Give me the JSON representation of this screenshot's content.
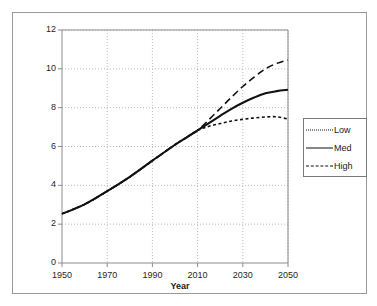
{
  "chart_data": {
    "type": "line",
    "title": "",
    "subtitle": "",
    "xlabel": "Year",
    "ylabel": "",
    "xlim": [
      1950,
      2050
    ],
    "ylim": [
      0,
      12
    ],
    "grid": true,
    "grid_style": "dotted",
    "legend_position": "right-outside",
    "x_ticks": [
      "1950",
      "1970",
      "1990",
      "2010",
      "2030",
      "2050"
    ],
    "x_tick_values": [
      1950,
      1970,
      1990,
      2010,
      2030,
      2050
    ],
    "y_ticks": [
      "0",
      "2",
      "4",
      "6",
      "8",
      "10",
      "12"
    ],
    "y_tick_values": [
      0,
      2,
      4,
      6,
      8,
      10,
      12
    ],
    "x": [
      1950,
      1960,
      1970,
      1980,
      1990,
      2000,
      2005,
      2010,
      2015,
      2020,
      2025,
      2030,
      2035,
      2040,
      2045,
      2050
    ],
    "series": [
      {
        "name": "Low",
        "line_style": "dotted",
        "color": "#111111",
        "values": [
          2.53,
          3.02,
          3.7,
          4.44,
          5.27,
          6.09,
          6.46,
          6.83,
          7.04,
          7.18,
          7.31,
          7.4,
          7.47,
          7.52,
          7.53,
          7.41
        ]
      },
      {
        "name": "Med",
        "line_style": "solid",
        "color": "#111111",
        "values": [
          2.53,
          3.02,
          3.7,
          4.44,
          5.27,
          6.09,
          6.46,
          6.83,
          7.21,
          7.58,
          7.94,
          8.25,
          8.52,
          8.74,
          8.85,
          8.92
        ]
      },
      {
        "name": "High",
        "line_style": "dashed",
        "color": "#111111",
        "values": [
          2.53,
          3.02,
          3.7,
          4.44,
          5.27,
          6.09,
          6.46,
          6.83,
          7.38,
          7.96,
          8.54,
          9.09,
          9.57,
          10.0,
          10.28,
          10.46
        ]
      }
    ],
    "annotations": []
  },
  "legend": {
    "entries": [
      {
        "label": "Low"
      },
      {
        "label": "Med"
      },
      {
        "label": "High"
      }
    ]
  },
  "axes": {
    "x_title": "Year"
  },
  "colors": {
    "line": "#111111",
    "grid": "#bdbdbd",
    "axis": "#8c8c8c",
    "frame": "#9a9a9a",
    "text": "#1f1f1f",
    "background": "#ffffff"
  }
}
